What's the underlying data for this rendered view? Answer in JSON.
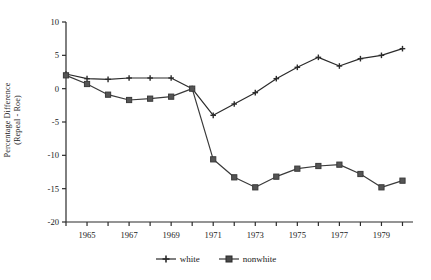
{
  "chart_data": {
    "type": "line",
    "title": "",
    "xlabel": "",
    "ylabel": "Percentage Difference (Repeal - Roe)",
    "ylabel_line1": "Percentage Difference",
    "ylabel_line2": "(Repeal - Roe)",
    "x": [
      1964,
      1965,
      1966,
      1967,
      1968,
      1969,
      1970,
      1971,
      1972,
      1973,
      1974,
      1975,
      1976,
      1977,
      1978,
      1979,
      1980
    ],
    "xlim": [
      1964,
      1980.5
    ],
    "ylim": [
      -20,
      10
    ],
    "yticks": [
      10,
      5,
      0,
      -5,
      -10,
      -15,
      -20
    ],
    "ytick_labels": [
      "10",
      "5",
      "0",
      "-5",
      "-10",
      "-15",
      "-20"
    ],
    "xticks": [
      1964,
      1965,
      1966,
      1967,
      1968,
      1969,
      1970,
      1971,
      1972,
      1973,
      1974,
      1975,
      1976,
      1977,
      1978,
      1979,
      1980
    ],
    "xtick_labels": [
      "",
      "1965",
      "",
      "1967",
      "",
      "1969",
      "",
      "1971",
      "",
      "1973",
      "",
      "1975",
      "",
      "1977",
      "",
      "1979",
      ""
    ],
    "grid": false,
    "legend_position": "bottom-center",
    "series": [
      {
        "name": "white",
        "marker": "plus",
        "color": "#2b2b2b",
        "values": [
          2.2,
          1.5,
          1.4,
          1.6,
          1.6,
          1.6,
          0.0,
          -4.0,
          -2.3,
          -0.6,
          1.5,
          3.2,
          4.7,
          3.4,
          4.5,
          5.0,
          6.0
        ]
      },
      {
        "name": "nonwhite",
        "marker": "square",
        "color": "#3a3a3a",
        "values": [
          2.0,
          0.7,
          -0.9,
          -1.7,
          -1.5,
          -1.2,
          0.0,
          -10.6,
          -13.3,
          -14.8,
          -13.2,
          -12.0,
          -11.6,
          -11.4,
          -12.8,
          -14.8,
          -13.8
        ]
      }
    ]
  },
  "legend": {
    "items": [
      {
        "label": "white",
        "marker": "plus"
      },
      {
        "label": "nonwhite",
        "marker": "square"
      }
    ]
  }
}
